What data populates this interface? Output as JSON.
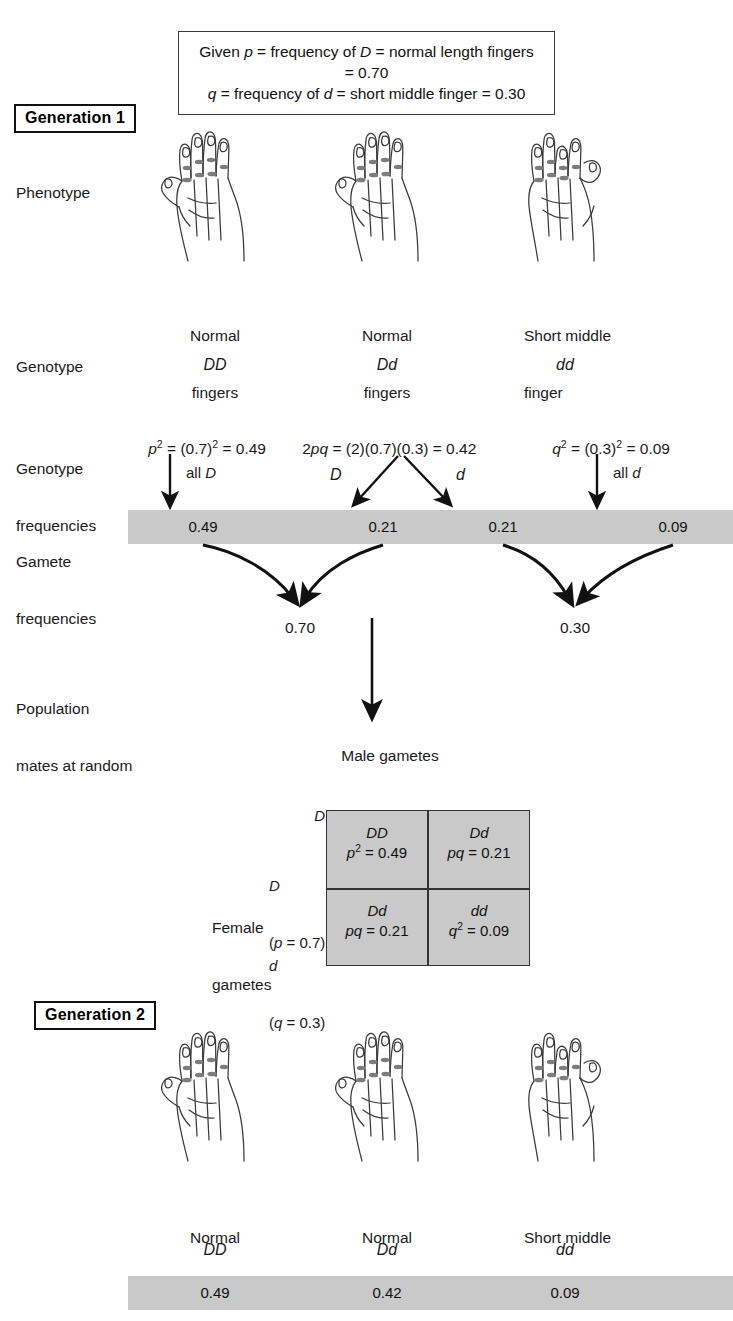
{
  "given_box": {
    "line1_prefix": "Given ",
    "line1": "Given p = frequency of D = normal length fingers = 0.70",
    "line2": "q = frequency of d = short middle finger = 0.30",
    "p_symbol": "p",
    "q_symbol": "q",
    "D_symbol": "D",
    "d_symbol": "d",
    "p_value": "0.70",
    "q_value": "0.30",
    "p_trait": "normal length fingers",
    "q_trait": "short middle finger",
    "given_word": "Given",
    "freq_word": "frequency of"
  },
  "generation1": {
    "badge": "Generation 1",
    "row_labels": {
      "phenotype": "Phenotype",
      "genotype": "Genotype",
      "genotype_frequencies_l1": "Genotype",
      "genotype_frequencies_l2": "frequencies",
      "gamete_frequencies_l1": "Gamete",
      "gamete_frequencies_l2": "frequencies",
      "population_l1": "Population",
      "population_l2": "mates at random"
    },
    "individuals": [
      {
        "phenotype_l1": "Normal",
        "phenotype_l2": "fingers",
        "genotype": "DD",
        "freq_expr": "p² = (0.7)² = 0.49",
        "gamete_note": "all D"
      },
      {
        "phenotype_l1": "Normal",
        "phenotype_l2": "fingers",
        "genotype": "Dd",
        "freq_expr": "2pq = (2)(0.7)(0.3) = 0.42",
        "gamete_note_left": "D",
        "gamete_note_right": "d"
      },
      {
        "phenotype_l1": "Short middle",
        "phenotype_l2": "finger",
        "genotype": "dd",
        "freq_expr": "q² = (0.3)² = 0.09",
        "gamete_note": "all d"
      }
    ],
    "gamete_bar_values": [
      "0.49",
      "0.21",
      "0.21",
      "0.09"
    ],
    "allele_totals": [
      "0.70",
      "0.30"
    ]
  },
  "punnett": {
    "male_title": "Male gametes",
    "female_title_l1": "Female",
    "female_title_l2": "gametes",
    "col_headers": [
      "D = (p = 0.7)",
      "d = (q = 0.3)"
    ],
    "row_headers": [
      {
        "allele": "D",
        "freq": "(p = 0.7)"
      },
      {
        "allele": "d",
        "freq": "(q = 0.3)"
      }
    ],
    "cells": [
      [
        {
          "genotype": "DD",
          "freq": "p² = 0.49"
        },
        {
          "genotype": "Dd",
          "freq": "pq = 0.21"
        }
      ],
      [
        {
          "genotype": "Dd",
          "freq": "pq = 0.21"
        },
        {
          "genotype": "dd",
          "freq": "q² = 0.09"
        }
      ]
    ]
  },
  "generation2": {
    "badge": "Generation 2",
    "individuals": [
      {
        "phenotype_l1": "Normal",
        "phenotype_l2": "fingers",
        "genotype": "DD",
        "frequency": "0.49"
      },
      {
        "phenotype_l1": "Normal",
        "phenotype_l2": "fingers",
        "genotype": "Dd",
        "frequency": "0.42"
      },
      {
        "phenotype_l1": "Short middle",
        "phenotype_l2": "finger",
        "genotype": "dd",
        "frequency": "0.09"
      }
    ]
  },
  "colors": {
    "bar_gray": "#c9c9c9",
    "ink": "#1a1a1a",
    "hand_stroke": "#3a3a3a",
    "knuckle": "#7d7d7d"
  }
}
